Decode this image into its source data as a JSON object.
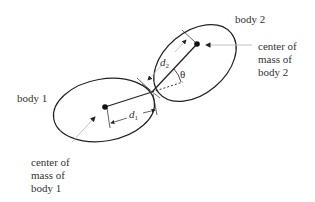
{
  "labels": {
    "body1": "body 1",
    "body2": "body 2",
    "com1": [
      "center of",
      "mass of",
      "body 1"
    ],
    "com2": [
      "center of",
      "mass of",
      "body 2"
    ],
    "d1": "d",
    "d1_sub": "1",
    "d2": "d",
    "d2_sub": "2",
    "theta": "θ"
  },
  "colors": {
    "outline": "#222222",
    "leader": "#bbbbbb",
    "text": "#333333"
  }
}
